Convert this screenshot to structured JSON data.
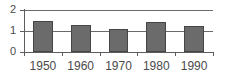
{
  "chart_data": {
    "type": "bar",
    "title": "",
    "subtitle": "",
    "xlabel": "",
    "ylabel": "",
    "categories": [
      "1950",
      "1960",
      "1970",
      "1980",
      "1990"
    ],
    "values": [
      1.48,
      1.28,
      1.1,
      1.45,
      1.22
    ],
    "series": [
      {
        "name": "",
        "values": [
          1.48,
          1.28,
          1.1,
          1.45,
          1.22
        ]
      }
    ],
    "ylim": [
      0,
      2
    ],
    "ytick_labels": [
      "0",
      "1",
      "2"
    ],
    "ytick_values": [
      0,
      1,
      2
    ],
    "grid": true,
    "grid_axis": "y",
    "legend": false,
    "legend_position": "none",
    "annotations": [],
    "colors": {
      "bar_fill": "#6b6b6b",
      "bar_edge": "#454545",
      "axis": "#5d5d5d",
      "gridline": "#6a6a6a",
      "text": "#4a4a4a",
      "background": "#ffffff"
    }
  },
  "axes": {
    "y": {
      "ticks": [
        {
          "label": "2",
          "value": 2
        },
        {
          "label": "1",
          "value": 1
        },
        {
          "label": "0",
          "value": 0
        }
      ]
    },
    "x": {
      "ticks": [
        {
          "label": "1950"
        },
        {
          "label": "1960"
        },
        {
          "label": "1970"
        },
        {
          "label": "1980"
        },
        {
          "label": "1990"
        }
      ]
    }
  }
}
